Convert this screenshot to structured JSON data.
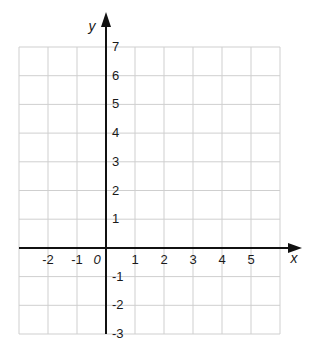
{
  "chart_data": {
    "type": "coordinate-plane",
    "title": "",
    "xlabel": "x",
    "ylabel": "y",
    "origin_label": "0",
    "xlim": [
      -3,
      6
    ],
    "ylim": [
      -3,
      7
    ],
    "grid": true,
    "x_ticks": [
      -3,
      -2,
      -1,
      0,
      1,
      2,
      3,
      4,
      5,
      6
    ],
    "y_ticks": [
      -3,
      -2,
      -1,
      0,
      1,
      2,
      3,
      4,
      5,
      6,
      7
    ],
    "x_tick_labels": [
      "-2",
      "-1",
      "1",
      "2",
      "3",
      "4",
      "5"
    ],
    "x_tick_label_values": [
      -2,
      -1,
      1,
      2,
      3,
      4,
      5
    ],
    "y_tick_labels": [
      "7",
      "6",
      "5",
      "4",
      "3",
      "2",
      "1",
      "-1",
      "-2",
      "-3"
    ],
    "y_tick_label_values": [
      7,
      6,
      5,
      4,
      3,
      2,
      1,
      -1,
      -2,
      -3
    ],
    "x_axis_arrow": true,
    "y_axis_arrow": true
  }
}
